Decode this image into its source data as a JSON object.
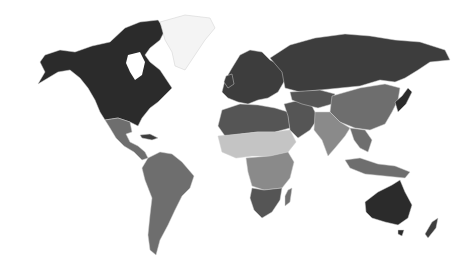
{
  "map": {
    "type": "choropleth-world",
    "style": "grayscale",
    "background": "#ffffff",
    "shades": {
      "darkest": "#2b2b2b",
      "dark": "#3d3d3d",
      "medium_dark": "#555555",
      "medium": "#6e6e6e",
      "medium_light": "#8a8a8a",
      "light": "#a9a9a9",
      "lighter": "#c4c4c4",
      "no_data": "#f4f4f4"
    },
    "regions": [
      {
        "name": "north-america",
        "shade": "darkest"
      },
      {
        "name": "greenland",
        "shade": "no_data"
      },
      {
        "name": "mexico-central-america",
        "shade": "medium"
      },
      {
        "name": "caribbean",
        "shade": "dark"
      },
      {
        "name": "south-america",
        "shade": "medium"
      },
      {
        "name": "europe",
        "shade": "dark"
      },
      {
        "name": "russia",
        "shade": "dark"
      },
      {
        "name": "north-africa",
        "shade": "medium_dark"
      },
      {
        "name": "sahel-west-africa",
        "shade": "lighter"
      },
      {
        "name": "central-africa",
        "shade": "medium_light"
      },
      {
        "name": "southern-africa",
        "shade": "medium_dark"
      },
      {
        "name": "madagascar",
        "shade": "medium"
      },
      {
        "name": "middle-east",
        "shade": "medium_dark"
      },
      {
        "name": "central-asia",
        "shade": "medium_dark"
      },
      {
        "name": "china-mongolia",
        "shade": "medium"
      },
      {
        "name": "south-asia",
        "shade": "medium_light"
      },
      {
        "name": "southeast-asia",
        "shade": "medium"
      },
      {
        "name": "japan-korea",
        "shade": "darkest"
      },
      {
        "name": "indonesia",
        "shade": "medium"
      },
      {
        "name": "australia",
        "shade": "darkest"
      },
      {
        "name": "new-zealand",
        "shade": "dark"
      }
    ]
  }
}
